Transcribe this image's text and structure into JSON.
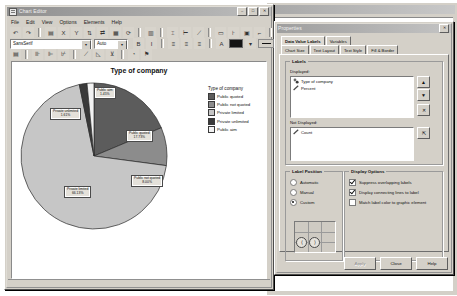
{
  "chart_editor": {
    "title": "Chart Editor",
    "window_buttons": [
      "–",
      "□",
      "✕"
    ],
    "menus": [
      "File",
      "Edit",
      "View",
      "Options",
      "Elements",
      "Help"
    ],
    "toolbar_row1": [
      {
        "name": "undo-icon",
        "glyph": "↶"
      },
      {
        "name": "redo-icon",
        "glyph": "↷"
      },
      {
        "sep": true
      },
      {
        "name": "show-data-labels-icon",
        "glyph": "▤"
      },
      {
        "name": "x-axis-icon",
        "glyph": "X"
      },
      {
        "name": "y-axis-icon",
        "glyph": "Y"
      },
      {
        "name": "transpose-icon",
        "glyph": "⇅"
      },
      {
        "name": "swap-axes-icon",
        "glyph": "⇄"
      },
      {
        "name": "chart-type-icon",
        "glyph": "▦"
      },
      {
        "name": "spin-icon",
        "glyph": "⟳"
      },
      {
        "sep": true
      },
      {
        "name": "grid-lines-icon",
        "glyph": "▥"
      },
      {
        "sep": true
      },
      {
        "name": "insert-vertical-ref-line-icon",
        "glyph": "⌶"
      },
      {
        "name": "insert-horizontal-ref-line-icon",
        "glyph": "⊢"
      },
      {
        "name": "insert-fit-line-icon",
        "glyph": "⟋"
      },
      {
        "sep": true
      },
      {
        "name": "insert-text-box-icon",
        "glyph": "▭"
      },
      {
        "name": "add-interpolation-line-icon",
        "glyph": "⊦"
      },
      {
        "name": "add-distribution-curve-icon",
        "glyph": "▣"
      },
      {
        "name": "add-markers-icon",
        "glyph": "⌐"
      },
      {
        "sep": true
      },
      {
        "name": "explode-slice-icon",
        "glyph": "▩"
      },
      {
        "name": "collapse-categories-icon",
        "glyph": "▨"
      },
      {
        "sep": true
      },
      {
        "name": "show-hide-legend-icon",
        "glyph": "⫿"
      },
      {
        "name": "bar-label-style-icon",
        "glyph": "⁞⁞"
      },
      {
        "sep": true
      },
      {
        "name": "play-animation-icon",
        "glyph": "▶"
      },
      {
        "name": "pause-animation-icon",
        "glyph": "⏸"
      }
    ],
    "font_family": "SansSerif",
    "font_size": "Auto",
    "format_buttons": [
      {
        "name": "bold-button",
        "glyph": "B"
      },
      {
        "name": "italic-button",
        "glyph": "I"
      },
      {
        "sep": true
      },
      {
        "name": "align-left-button",
        "glyph": "≡"
      },
      {
        "name": "align-center-button",
        "glyph": "≡"
      },
      {
        "name": "align-right-button",
        "glyph": "≡"
      },
      {
        "sep": true
      },
      {
        "name": "text-color-button",
        "glyph": "A"
      }
    ],
    "fill_color": "#141414",
    "toolbar_row3": [
      {
        "name": "edit-properties-icon",
        "glyph": "▤"
      },
      {
        "sep": true
      },
      {
        "name": "bar-chart-icon",
        "glyph": "⊪"
      },
      {
        "name": "stacked-bar-icon",
        "glyph": "⊫"
      },
      {
        "name": "clustered-bar-icon",
        "glyph": "⊬"
      },
      {
        "sep": true
      },
      {
        "name": "line-chart-icon",
        "glyph": "⟋"
      },
      {
        "name": "area-chart-icon",
        "glyph": "◺"
      },
      {
        "name": "drop-line-icon",
        "glyph": "⊻"
      },
      {
        "sep": true
      },
      {
        "name": "pie-chart-icon",
        "glyph": "◔"
      },
      {
        "name": "apply-chart-template-icon",
        "glyph": "⚑"
      }
    ],
    "status_text": ""
  },
  "chart_data": {
    "type": "pie",
    "title": "Type of company",
    "legend_title": "Type of company",
    "legend_position": "right",
    "xlabel": "",
    "ylabel": "",
    "categories": [
      "Public quoted",
      "Public not quoted",
      "Private limited",
      "Private unlimited",
      "Public aim"
    ],
    "values": [
      17.73,
      8.0,
      66.13,
      1.61,
      1.45
    ],
    "value_unit": "percent",
    "colors": [
      "#5c5c5c",
      "#8c8c8c",
      "#c6c6c6",
      "#3a3a3a",
      "#f2f2f2"
    ],
    "data_labels": [
      {
        "name": "Public quoted",
        "value": "17.73%"
      },
      {
        "name": "Public not quoted",
        "value": "8.00%"
      },
      {
        "name": "Private limited",
        "value": "66.13%"
      },
      {
        "name": "Private unlimited",
        "value": "1.61%"
      },
      {
        "name": "Public aim",
        "value": "1.45%"
      }
    ]
  },
  "properties": {
    "title": "Properties",
    "close_glyph": "✕",
    "tabs_row1": [
      {
        "label": "Data Value Labels",
        "selected": true
      },
      {
        "label": "Variables",
        "selected": false
      }
    ],
    "tabs_row2": [
      {
        "label": "Chart Size",
        "selected": false
      },
      {
        "label": "Text Layout",
        "selected": false
      },
      {
        "label": "Text Style",
        "selected": false
      },
      {
        "label": "Fill & Border",
        "selected": false
      }
    ],
    "labels_group": {
      "title": "Labels",
      "displayed_label": "Displayed:",
      "displayed_items": [
        {
          "text": "Type of company",
          "icon": "nominal-variable-icon"
        },
        {
          "text": "Percent",
          "icon": "scale-variable-icon"
        }
      ],
      "not_displayed_label": "Not Displayed:",
      "not_displayed_items": [
        {
          "text": "Count",
          "icon": "scale-variable-icon"
        }
      ],
      "move_up_glyph": "▲",
      "move_down_glyph": "▼",
      "remove_glyph": "✕",
      "add_glyph": "⇱"
    },
    "label_position_group": {
      "title": "Label Position",
      "options": [
        {
          "label": "Automatic",
          "selected": false
        },
        {
          "label": "Manual",
          "selected": false
        },
        {
          "label": "Custom",
          "selected": true
        }
      ],
      "handle_left_glyph": "⟨",
      "handle_right_glyph": "⟩"
    },
    "display_options_group": {
      "title": "Display Options",
      "checkboxes": [
        {
          "label": "Suppress overlapping labels",
          "checked": true
        },
        {
          "label": "Display connecting lines to label",
          "checked": true
        },
        {
          "label": "Match label color to graphic element",
          "checked": false
        }
      ]
    },
    "buttons": [
      {
        "label": "Apply",
        "enabled": false
      },
      {
        "label": "Close",
        "enabled": true
      },
      {
        "label": "Help",
        "enabled": true
      }
    ]
  }
}
